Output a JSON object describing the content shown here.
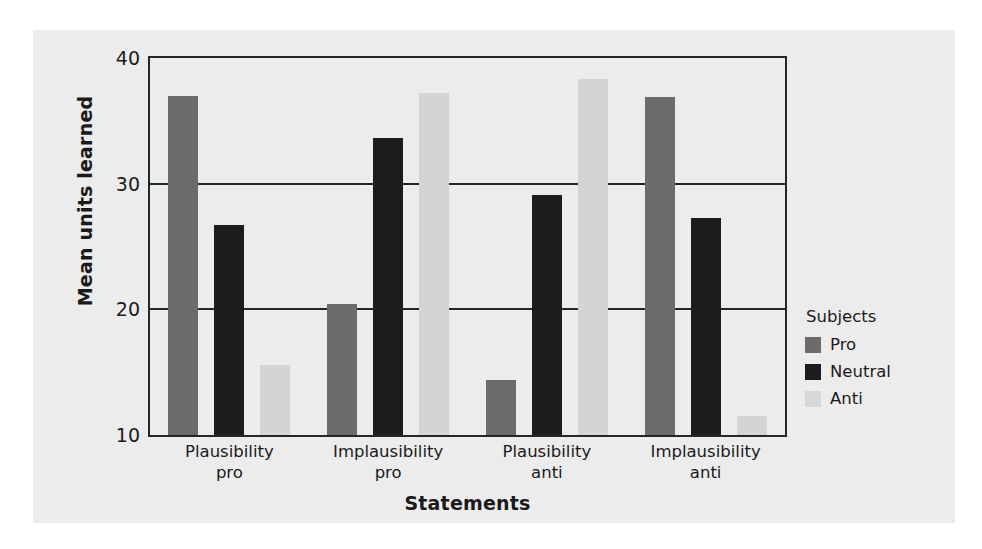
{
  "chart_data": {
    "type": "bar",
    "title": "",
    "xlabel": "Statements",
    "ylabel": "Mean units learned",
    "categories": [
      "Plausibility\npro",
      "Implausibility\npro",
      "Plausibility\nanti",
      "Implausibility\nanti"
    ],
    "category_lines": [
      [
        "Plausibility",
        "pro"
      ],
      [
        "Implausibility",
        "pro"
      ],
      [
        "Plausibility",
        "anti"
      ],
      [
        "Implausibility",
        "anti"
      ]
    ],
    "series": [
      {
        "name": "Pro",
        "color": "#6b6b6b",
        "values": [
          37.0,
          20.4,
          14.4,
          36.9
        ]
      },
      {
        "name": "Neutral",
        "color": "#1c1c1c",
        "values": [
          26.7,
          33.6,
          29.1,
          27.3
        ]
      },
      {
        "name": "Anti",
        "color": "#d4d4d4",
        "values": [
          15.6,
          37.2,
          38.3,
          11.5
        ]
      }
    ],
    "ylim": [
      10,
      40
    ],
    "yticks": [
      10,
      20,
      30,
      40
    ],
    "ytick_labels": [
      "10",
      "20",
      "30",
      "40"
    ],
    "grid": true,
    "legend_title": "Subjects",
    "legend_position": "right"
  },
  "legend": {
    "title": "Subjects",
    "entries": [
      {
        "label": "Pro"
      },
      {
        "label": "Neutral"
      },
      {
        "label": "Anti"
      }
    ]
  },
  "axes": {
    "y_title": "Mean units learned",
    "x_title": "Statements"
  }
}
